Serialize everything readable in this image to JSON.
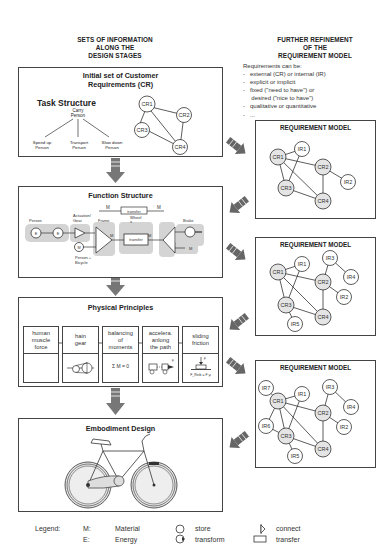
{
  "left_column_title": [
    "SETS OF INFORMATION",
    "ALONG THE",
    "DESIGN STAGES"
  ],
  "right_column_title": [
    "FURTHER REFINEMENT",
    "OF THE",
    "REQUIREMENT MODEL"
  ],
  "requirements_note": {
    "heading": "Requirements can be:",
    "items": [
      "external (CR) or internal (IR)",
      "explicit or implicit",
      "fixed (\"need to have\") or",
      "desired (\"nice to have\")",
      "qualitative or quantitative",
      "..."
    ]
  },
  "stages": [
    {
      "title_line1": "Initial set of Customer",
      "title_line2": "Requirements (CR)",
      "task_structure": {
        "title": "Task Structure",
        "root": [
          "Carry",
          "Person"
        ],
        "children": [
          [
            "Speed up",
            "Person"
          ],
          [
            "Transport",
            "Person"
          ],
          [
            "Slow down",
            "Person"
          ]
        ]
      },
      "graph_nodes": [
        "CR1",
        "CR2",
        "CR3",
        "CR4"
      ]
    },
    {
      "title": "Function Structure",
      "labels": {
        "person": "Person",
        "actuation": [
          "Actuation/",
          "Gear"
        ],
        "frame": "Frame",
        "wheel": [
          "Wheel",
          "s"
        ],
        "brake": "Brake",
        "person_bicycle": [
          "Person +",
          "Bicycle"
        ],
        "transfer": "transfer",
        "M": "M",
        "E": "E"
      }
    },
    {
      "title": "Physical Principles",
      "cells": [
        {
          "label": [
            "human",
            "muscle",
            "force"
          ],
          "formula": ""
        },
        {
          "label": [
            "hain",
            "gear"
          ],
          "formula": ""
        },
        {
          "label": [
            "balancing",
            "of",
            "moments"
          ],
          "formula": "Σ M = 0"
        },
        {
          "label": [
            "accelera.",
            "anlong",
            "the path"
          ],
          "formula": ""
        },
        {
          "label": [
            "sliding",
            "friction"
          ],
          "formula": "F_Reib = F·μ"
        }
      ]
    },
    {
      "title": "Embodiment Design"
    }
  ],
  "requirement_models": [
    {
      "title": "REQUIREMENT MODEL",
      "nodes": [
        "CR1",
        "IR1",
        "CR2",
        "IR2",
        "CR3",
        "CR4"
      ]
    },
    {
      "title": "REQUIREMENT MODEL",
      "nodes": [
        "CR1",
        "IR1",
        "IR3",
        "IR4",
        "CR2",
        "IR2",
        "CR3",
        "CR4",
        "IR5"
      ]
    },
    {
      "title": "REQUIREMENT MODEL",
      "nodes": [
        "IR7",
        "CR1",
        "IR1",
        "IR3",
        "IR4",
        "CR2",
        "IR6",
        "IR2",
        "CR3",
        "CR4",
        "IR5"
      ]
    }
  ],
  "legend": {
    "label": "Legend:",
    "abbrev": [
      {
        "key": "M:",
        "value": "Material"
      },
      {
        "key": "E:",
        "value": "Energy"
      }
    ],
    "symbols_a": [
      "store",
      "transform"
    ],
    "symbols_b": [
      "connect",
      "transfer"
    ]
  },
  "colors": {
    "arrow": "#6a6a6a",
    "shade": "#d4d4d4",
    "node_fill": "#e4e4e4",
    "line": "#333333"
  }
}
